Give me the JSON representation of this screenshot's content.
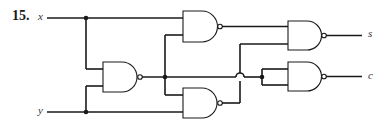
{
  "problem": {
    "number": "15."
  },
  "inputs": [
    {
      "name": "x",
      "label": "x"
    },
    {
      "name": "y",
      "label": "y"
    }
  ],
  "outputs": [
    {
      "name": "s",
      "label": "s"
    },
    {
      "name": "c",
      "label": "c"
    }
  ],
  "gates": [
    {
      "id": "g1",
      "type": "NAND",
      "inputs": [
        "x",
        "y"
      ]
    },
    {
      "id": "g2",
      "type": "NAND",
      "inputs": [
        "x",
        "g1"
      ]
    },
    {
      "id": "g3",
      "type": "NAND",
      "inputs": [
        "g1",
        "y"
      ]
    },
    {
      "id": "g4",
      "type": "NAND",
      "inputs": [
        "g2",
        "g3"
      ],
      "output": "s"
    },
    {
      "id": "g5",
      "type": "NAND",
      "inputs": [
        "g1",
        "g1"
      ],
      "output": "c"
    }
  ],
  "colors": {
    "line": "#1a1a1a",
    "background": "#ffffff"
  }
}
